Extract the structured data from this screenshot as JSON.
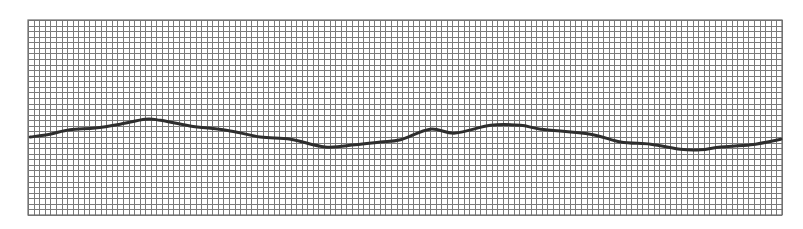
{
  "chart_data": {
    "type": "line",
    "title": "",
    "xlabel": "",
    "ylabel": "",
    "grid": true,
    "legend": null,
    "grid_columns": 135,
    "grid_rows": 35,
    "xlim": [
      0,
      135
    ],
    "ylim_from_top": [
      0,
      35
    ],
    "colors": {
      "background": "#ffffff",
      "grid": "#7a7a7a",
      "trace": "#2e2e2e"
    },
    "series": [
      {
        "name": "trace",
        "x": [
          0.4,
          3.9,
          7.5,
          12.0,
          16.5,
          21.0,
          23.7,
          29.0,
          36.2,
          41.6,
          47.0,
          53.2,
          58.6,
          63.1,
          66.7,
          72.0,
          76.5,
          82.8,
          88.2,
          91.8,
          100.7,
          106.1,
          111.5,
          116.8,
          120.4,
          124.0,
          129.4,
          134.8
        ],
        "y": [
          21.0,
          20.5,
          19.7,
          19.4,
          18.7,
          17.8,
          18.0,
          19.0,
          19.9,
          21.0,
          21.4,
          22.8,
          22.4,
          21.9,
          21.5,
          19.6,
          20.3,
          18.9,
          18.9,
          19.6,
          20.5,
          21.9,
          22.3,
          23.2,
          23.3,
          22.8,
          22.4,
          21.4
        ]
      }
    ]
  }
}
